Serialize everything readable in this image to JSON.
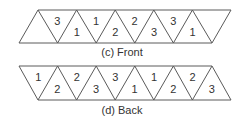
{
  "strips": [
    {
      "id": "front",
      "caption": "(c) Front",
      "orientation": "top-shifted-right",
      "triangles": [
        {
          "pointing": "up",
          "label": ""
        },
        {
          "pointing": "down",
          "label": "3"
        },
        {
          "pointing": "up",
          "label": "1"
        },
        {
          "pointing": "down",
          "label": "1"
        },
        {
          "pointing": "up",
          "label": "2"
        },
        {
          "pointing": "down",
          "label": "2"
        },
        {
          "pointing": "up",
          "label": "3"
        },
        {
          "pointing": "down",
          "label": "3"
        },
        {
          "pointing": "up",
          "label": "1"
        },
        {
          "pointing": "down",
          "label": ""
        }
      ]
    },
    {
      "id": "back",
      "caption": "(d) Back",
      "orientation": "bottom-shifted-right",
      "triangles": [
        {
          "pointing": "down",
          "label": "1"
        },
        {
          "pointing": "up",
          "label": "2"
        },
        {
          "pointing": "down",
          "label": "2"
        },
        {
          "pointing": "up",
          "label": "3"
        },
        {
          "pointing": "down",
          "label": "3"
        },
        {
          "pointing": "up",
          "label": "1"
        },
        {
          "pointing": "down",
          "label": "1"
        },
        {
          "pointing": "up",
          "label": "2"
        },
        {
          "pointing": "down",
          "label": "2"
        },
        {
          "pointing": "up",
          "label": "3"
        }
      ]
    }
  ]
}
